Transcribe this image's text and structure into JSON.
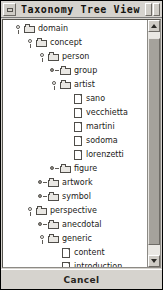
{
  "window": {
    "title": "Taxonomy Tree View",
    "sysbox_icon": "window-menu-icon",
    "minimize_icon": "minimize-icon",
    "maximize_icon": "maximize-icon"
  },
  "scrollbar": {
    "up_arrow": "▲",
    "down_arrow": "▼",
    "orientation": "vertical"
  },
  "footer": {
    "cancel_label": "Cancel"
  },
  "tree": {
    "nodes": [
      {
        "label": "domain",
        "depth": 0,
        "type": "folder",
        "state": "expanded"
      },
      {
        "label": "concept",
        "depth": 1,
        "type": "folder",
        "state": "expanded"
      },
      {
        "label": "person",
        "depth": 2,
        "type": "folder",
        "state": "expanded"
      },
      {
        "label": "group",
        "depth": 3,
        "type": "folder",
        "state": "collapsed"
      },
      {
        "label": "artist",
        "depth": 3,
        "type": "folder",
        "state": "expanded"
      },
      {
        "label": "sano",
        "depth": 4,
        "type": "doc",
        "state": "leaf"
      },
      {
        "label": "vecchietta",
        "depth": 4,
        "type": "doc",
        "state": "leaf"
      },
      {
        "label": "martini",
        "depth": 4,
        "type": "doc",
        "state": "leaf"
      },
      {
        "label": "sodoma",
        "depth": 4,
        "type": "doc",
        "state": "leaf"
      },
      {
        "label": "lorenzetti",
        "depth": 4,
        "type": "doc",
        "state": "leaf"
      },
      {
        "label": "figure",
        "depth": 3,
        "type": "folder",
        "state": "collapsed"
      },
      {
        "label": "artwork",
        "depth": 2,
        "type": "folder",
        "state": "collapsed"
      },
      {
        "label": "symbol",
        "depth": 2,
        "type": "folder",
        "state": "collapsed"
      },
      {
        "label": "perspective",
        "depth": 1,
        "type": "folder",
        "state": "expanded"
      },
      {
        "label": "anecdotal",
        "depth": 2,
        "type": "folder",
        "state": "collapsed"
      },
      {
        "label": "generic",
        "depth": 2,
        "type": "folder",
        "state": "expanded"
      },
      {
        "label": "content",
        "depth": 3,
        "type": "doc",
        "state": "leaf"
      },
      {
        "label": "introduction",
        "depth": 3,
        "type": "doc",
        "state": "leaf"
      },
      {
        "label": "overview",
        "depth": 3,
        "type": "doc",
        "state": "leaf"
      },
      {
        "label": "historical",
        "depth": 2,
        "type": "folder",
        "state": "collapsed"
      },
      {
        "label": "artistic",
        "depth": 2,
        "type": "folder",
        "state": "collapsed"
      }
    ]
  },
  "colors": {
    "window_face": "#d6d3ce",
    "tree_background": "#ffffff",
    "text": "#1b1a18",
    "scroll_thumb": "#a5a29c"
  }
}
